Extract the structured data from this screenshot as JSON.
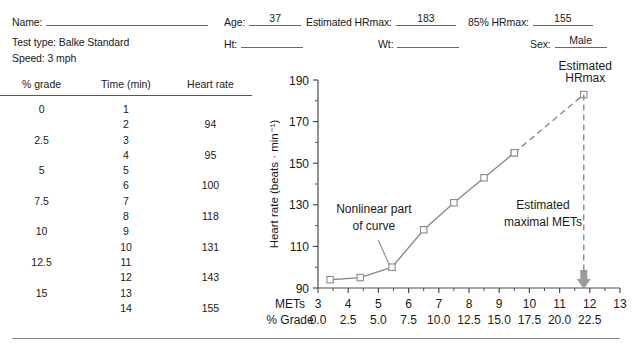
{
  "form": {
    "name_label": "Name:",
    "name_value": "",
    "age_label": "Age:",
    "age_value": "37",
    "est_hrmax_label": "Estimated HRmax:",
    "est_hrmax_value": "183",
    "pct85_hrmax_label": "85% HRmax:",
    "pct85_hrmax_value": "155",
    "test_type_line": "Test type: Balke Standard",
    "speed_line": "Speed: 3 mph",
    "ht_label": "Ht:",
    "ht_value": "",
    "wt_label": "Wt:",
    "wt_value": "",
    "sex_label": "Sex:",
    "sex_value": "Male"
  },
  "table": {
    "headers": [
      "% grade",
      "Time (min)",
      "Heart rate"
    ],
    "rows": [
      [
        "0",
        "1",
        ""
      ],
      [
        "",
        "2",
        "94"
      ],
      [
        "2.5",
        "3",
        ""
      ],
      [
        "",
        "4",
        "95"
      ],
      [
        "5",
        "5",
        ""
      ],
      [
        "",
        "6",
        "100"
      ],
      [
        "7.5",
        "7",
        ""
      ],
      [
        "",
        "8",
        "118"
      ],
      [
        "10",
        "9",
        ""
      ],
      [
        "",
        "10",
        "131"
      ],
      [
        "12.5",
        "11",
        ""
      ],
      [
        "",
        "12",
        "143"
      ],
      [
        "15",
        "13",
        ""
      ],
      [
        "",
        "14",
        "155"
      ]
    ]
  },
  "chart_data": {
    "type": "line",
    "title": "",
    "xlabel": "METs",
    "ylabel": "Heart rate (beats · min⁻¹)",
    "x_axis_row1_label": "METs",
    "x_axis_row2_label": "% Grade",
    "xlim": [
      3,
      13
    ],
    "ylim": [
      90,
      190
    ],
    "x_ticks": [
      "3",
      "4",
      "5",
      "6",
      "7",
      "8",
      "9",
      "10",
      "11",
      "12",
      "13"
    ],
    "x_ticks_grade": [
      "0.0",
      "2.5",
      "5.0",
      "7.5",
      "10.0",
      "12.5",
      "15.0",
      "17.5",
      "20.0",
      "22.5"
    ],
    "y_ticks": [
      "90",
      "110",
      "130",
      "150",
      "170",
      "190"
    ],
    "y_minor_ticks": [
      100,
      120,
      140,
      160,
      180
    ],
    "grid": false,
    "legend": false,
    "series": [
      {
        "name": "Measured heart rate",
        "style": "solid",
        "marker": "open-square",
        "x": [
          3.4,
          4.4,
          5.45,
          6.5,
          7.5,
          8.5,
          9.5
        ],
        "y": [
          94,
          95,
          100,
          118,
          131,
          143,
          155
        ]
      },
      {
        "name": "Extrapolation to estimated HRmax",
        "style": "dashed",
        "marker": "open-square",
        "x": [
          9.5,
          11.8
        ],
        "y": [
          155,
          183
        ]
      }
    ],
    "annotations": [
      {
        "text": "Nonlinear part\nof curve",
        "line1": "Nonlinear part",
        "line2": "of curve",
        "x": 4.6,
        "y": 120
      },
      {
        "text": "Estimated\nHRmax",
        "line1": "Estimated",
        "line2": "HRmax",
        "x": 11.8,
        "y": 190
      },
      {
        "text": "Estimated\nmaximal METs",
        "line1": "Estimated",
        "line2": "maximal METs",
        "x": 10.4,
        "y": 122
      }
    ],
    "markers_note": "open squares",
    "dropline": {
      "x": 11.8,
      "from_y": 183,
      "to_y": 90,
      "style": "dashed",
      "arrow": "down"
    }
  },
  "colors": {
    "ink": "#1a1a1a",
    "line": "#8a8a8a",
    "axis": "#4d4d4d",
    "rule": "#8a8a8a"
  }
}
